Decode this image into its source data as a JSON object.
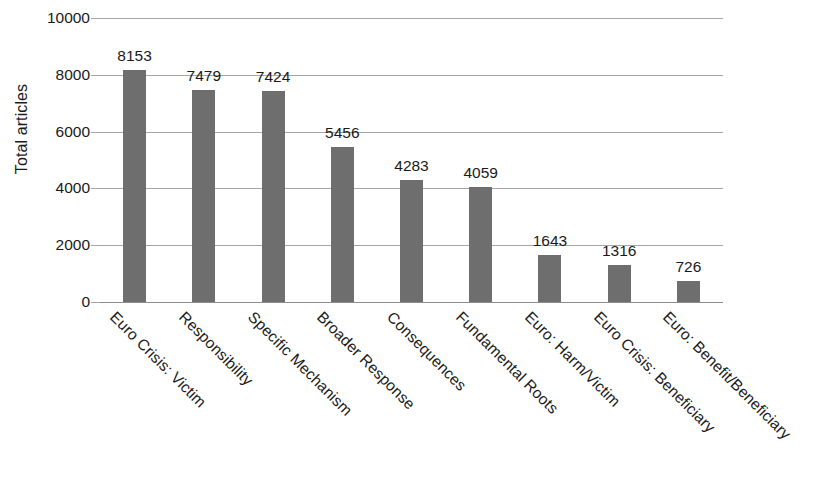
{
  "chart_data": {
    "type": "bar",
    "title": "",
    "subtitle": "",
    "xlabel": "",
    "ylabel": "Total articles",
    "categories": [
      "Euro Crisis: Victim",
      "Responsibility",
      "Specific Mechanism",
      "Broader Response",
      "Consequences",
      "Fundamental Roots",
      "Euro: Harm/Victim",
      "Euro Crisis: Beneficiary",
      "Euro: Benefit/Beneficiary"
    ],
    "values": [
      8153,
      7479,
      7424,
      5456,
      4283,
      4059,
      1643,
      1316,
      726
    ],
    "ylim": [
      0,
      10000
    ],
    "yticks": [
      0,
      2000,
      4000,
      6000,
      8000,
      10000
    ],
    "ytick_labels": [
      "0",
      "2000",
      "4000",
      "6000",
      "8000",
      "10000"
    ],
    "grid": true,
    "legend": false,
    "legend_position": "none",
    "data_labels": [
      "8153",
      "7479",
      "7424",
      "5456",
      "4283",
      "4059",
      "1643",
      "1316",
      "726"
    ],
    "bar_color": "#6e6e6e",
    "gridline_color": "#a6a6a6",
    "background_color": "#ffffff",
    "xtick_label_rotation": -45
  },
  "axes": {
    "y_title": "Total articles"
  }
}
